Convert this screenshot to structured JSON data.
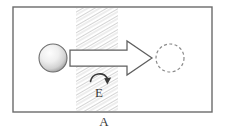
{
  "figure": {
    "frame": {
      "name": "outer-frame",
      "x": 13,
      "y": 7,
      "width": 199,
      "height": 105,
      "stroke": "#6b6b6b",
      "fill": "#ffffff",
      "stroke_width": 1.4
    },
    "band": {
      "name": "hatched-band",
      "label": "A",
      "x": 76,
      "y": 8,
      "width": 42,
      "height": 103,
      "hatch_color": "#c9c9c9",
      "hatch_angle_deg": 60,
      "hatch_spacing": 3
    },
    "source_ball": {
      "name": "solid-sphere",
      "cx": 53,
      "cy": 58,
      "r": 14,
      "fill_light": "#fbfbfb",
      "fill_dark": "#9a9a9a",
      "stroke": "#6e6e6e"
    },
    "target_ball": {
      "name": "dashed-circle",
      "cx": 170,
      "cy": 58,
      "r": 14,
      "stroke": "#8a8a8a",
      "dash": "3 2.4"
    },
    "block_arrow": {
      "name": "translation-arrow",
      "tail_x": 70,
      "tip_x": 152,
      "center_y": 58,
      "shaft_half_height": 8,
      "head_half_height": 17,
      "head_length": 25,
      "stroke": "#5f5f5f",
      "fill": "#ffffff"
    },
    "rotation_arrow": {
      "name": "rotation-arrow",
      "label": "E",
      "label_x": 99,
      "label_y": 93,
      "arc_cx": 99,
      "arc_cy": 78,
      "arc_r": 9,
      "stroke": "#3a3a3a"
    },
    "labels": {
      "band_label": "A",
      "band_label_x": 104,
      "band_label_y": 123,
      "rotation_label": "E"
    },
    "colors": {
      "background": "#ffffff",
      "frame_stroke": "#6b6b6b",
      "hatch": "#c9c9c9",
      "text": "#3a3a3a"
    }
  }
}
